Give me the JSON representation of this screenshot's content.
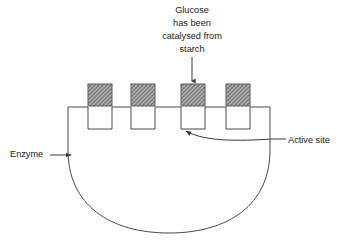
{
  "diagram": {
    "type": "biology-schematic",
    "colors": {
      "background": "#ffffff",
      "outline": "#4a4a4a",
      "leader": "#3a3a3a",
      "text": "#1a1a1a",
      "block_fill": "#9a9a9a",
      "block_border": "#5a5a5a"
    },
    "labels": {
      "glucose_line1": "Glucose",
      "glucose_line2": "has been",
      "glucose_line3": "catalysed from",
      "glucose_line4": "starch",
      "enzyme": "Enzyme",
      "active_site": "Active site"
    },
    "blocks": [
      {
        "name": "substrate-block-1",
        "x": 88,
        "y": 84,
        "width": 24,
        "height": 22
      },
      {
        "name": "substrate-block-2",
        "x": 131,
        "y": 84,
        "width": 24,
        "height": 22
      },
      {
        "name": "substrate-block-3",
        "x": 181,
        "y": 84,
        "width": 24,
        "height": 22
      },
      {
        "name": "substrate-block-4",
        "x": 226,
        "y": 84,
        "width": 24,
        "height": 22
      }
    ],
    "notches": [
      {
        "name": "active-site-notch-1",
        "x": 88,
        "width": 24,
        "depth": 22
      },
      {
        "name": "active-site-notch-2",
        "x": 131,
        "width": 24,
        "depth": 22
      },
      {
        "name": "active-site-notch-3",
        "x": 181,
        "width": 24,
        "depth": 22
      },
      {
        "name": "active-site-notch-4",
        "x": 226,
        "width": 24,
        "depth": 22
      }
    ],
    "body": {
      "left_x": 68,
      "right_x": 270,
      "top_y": 107,
      "side_bottom_y": 150,
      "curve_bottom_y": 233
    },
    "glucose_arrow": {
      "x": 192,
      "y_start": 57,
      "y_end": 83
    },
    "enzyme_arrow": {
      "x_start": 48,
      "x_end": 72,
      "y": 155
    },
    "active_site_leader": {
      "from_x": 286,
      "from_y": 139,
      "to_x": 185,
      "to_y": 130
    }
  }
}
